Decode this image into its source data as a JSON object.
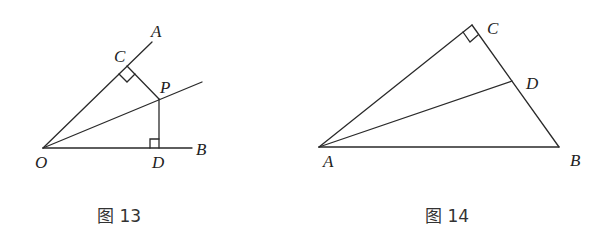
{
  "figures": [
    {
      "caption": "图 13",
      "labels": {
        "A": "A",
        "B": "B",
        "C": "C",
        "D": "D",
        "O": "O",
        "P": "P"
      },
      "points": {
        "O": [
          43,
          148
        ],
        "A_end": [
          152,
          42
        ],
        "B_end": [
          192,
          148
        ],
        "C": [
          127,
          66
        ],
        "P": [
          159,
          99
        ],
        "D": [
          159,
          148
        ],
        "bisector_end": [
          202,
          82
        ]
      },
      "segments": [
        "OA",
        "OB",
        "OP-ray",
        "PC",
        "PD"
      ],
      "right_angles": [
        "C",
        "D"
      ]
    },
    {
      "caption": "图 14",
      "labels": {
        "A": "A",
        "B": "B",
        "C": "C",
        "D": "D"
      },
      "points": {
        "A": [
          319,
          147
        ],
        "B": [
          559,
          147
        ],
        "C": [
          472,
          25
        ],
        "D": [
          512,
          81
        ]
      },
      "segments": [
        "AB",
        "AC",
        "CB",
        "AD"
      ],
      "right_angles": [
        "C"
      ]
    }
  ]
}
